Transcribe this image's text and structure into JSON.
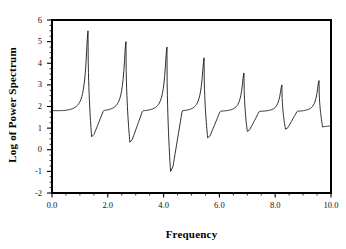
{
  "chart_data": {
    "type": "line",
    "title": "",
    "xlabel": "Frequency",
    "ylabel": "Log of Power Spectrum",
    "xlim": [
      0.0,
      10.0
    ],
    "ylim": [
      -2,
      6
    ],
    "xticks": [
      "0.0",
      "2.0",
      "4.0",
      "6.0",
      "8.0",
      "10.0"
    ],
    "xtick_values": [
      0.0,
      2.0,
      4.0,
      6.0,
      8.0,
      10.0
    ],
    "xminor_step": 0.5,
    "yticks": [
      "6",
      "5",
      "4",
      "3",
      "2",
      "1",
      "0",
      "-1",
      "-2"
    ],
    "ytick_values": [
      6,
      5,
      4,
      3,
      2,
      1,
      0,
      -1,
      -2
    ],
    "yminor_step": 0.25,
    "grid": false,
    "legend": false,
    "line_color": "#1a1a1a",
    "line_width": 0.9,
    "frame_color": "#000000",
    "background": "#ffffff",
    "series": [
      {
        "name": "Log of Power Spectrum",
        "description": "Seven sharp resonance peaks with anti-resonance dips; quasi-periodic spacing ~1.37 frequency units",
        "peaks": [
          {
            "x": 1.29,
            "y": 5.5
          },
          {
            "x": 2.65,
            "y": 5.0
          },
          {
            "x": 4.12,
            "y": 4.75
          },
          {
            "x": 5.45,
            "y": 4.25
          },
          {
            "x": 6.88,
            "y": 3.55
          },
          {
            "x": 8.24,
            "y": 3.0
          },
          {
            "x": 9.57,
            "y": 3.2
          }
        ],
        "minima": [
          {
            "x": 1.42,
            "y": 0.6
          },
          {
            "x": 2.79,
            "y": 0.35
          },
          {
            "x": 4.25,
            "y": -1.0
          },
          {
            "x": 5.58,
            "y": 0.55
          },
          {
            "x": 7.0,
            "y": 0.85
          },
          {
            "x": 8.37,
            "y": 0.95
          },
          {
            "x": 9.7,
            "y": 1.05
          }
        ],
        "start_point": {
          "x": 0.0,
          "y": 1.78
        },
        "end_point": {
          "x": 10.0,
          "y": 1.1
        },
        "baseline": 1.75
      }
    ]
  },
  "axes": {
    "x_title": "Frequency",
    "y_title": "Log of Power Spectrum"
  }
}
